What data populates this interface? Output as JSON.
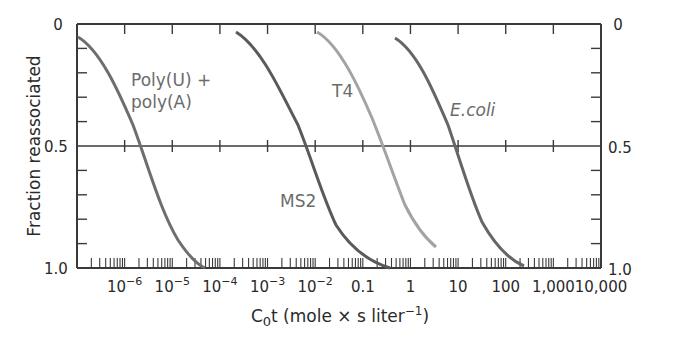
{
  "chart_data": {
    "type": "line",
    "title": "",
    "xlabel": "C0t (mole × s liter−1)",
    "xlabel_parts": {
      "c": "C",
      "sub": "0",
      "rest": "t (mole × s liter",
      "sup": "−1",
      "close": ")"
    },
    "ylabel": "Fraction reassociated",
    "x_scale": "log",
    "xlim": [
      1e-07,
      10000
    ],
    "ylim": [
      0,
      1.0
    ],
    "y_inverted": true,
    "x_tick_labels": [
      {
        "label": "10",
        "exp": "−6",
        "value": 1e-06
      },
      {
        "label": "10",
        "exp": "−5",
        "value": 1e-05
      },
      {
        "label": "10",
        "exp": "−4",
        "value": 0.0001
      },
      {
        "label": "10",
        "exp": "−3",
        "value": 0.001
      },
      {
        "label": "10",
        "exp": "−2",
        "value": 0.01
      },
      {
        "label": "0.1",
        "exp": "",
        "value": 0.1
      },
      {
        "label": "1",
        "exp": "",
        "value": 1
      },
      {
        "label": "10",
        "exp": "",
        "value": 10
      },
      {
        "label": "100",
        "exp": "",
        "value": 100
      },
      {
        "label": "1,000",
        "exp": "",
        "value": 1000
      },
      {
        "label": "10,000",
        "exp": "",
        "value": 10000
      }
    ],
    "y_tick_labels_left": [
      "0",
      "0.5",
      "1.0"
    ],
    "y_tick_labels_right": [
      "0",
      "0.5",
      "1.0"
    ],
    "reference_line": {
      "y": 0.5
    },
    "grid": false,
    "legend": "inline labels",
    "series": [
      {
        "name": "Poly(U) + poly(A)",
        "label_lines": [
          "Poly(U) +",
          "poly(A)"
        ],
        "color": "#6e6e6e",
        "cot_half": 2e-06,
        "points": [
          [
            1e-07,
            0.05
          ],
          [
            1e-06,
            0.3
          ],
          [
            2e-06,
            0.5
          ],
          [
            1e-05,
            0.85
          ],
          [
            7e-05,
            1.0
          ]
        ]
      },
      {
        "name": "MS2",
        "label_lines": [
          "MS2"
        ],
        "color": "#5a5a5a",
        "cot_half": 0.01,
        "points": [
          [
            0.0004,
            0.03
          ],
          [
            0.003,
            0.25
          ],
          [
            0.01,
            0.5
          ],
          [
            0.05,
            0.8
          ],
          [
            0.35,
            1.0
          ]
        ]
      },
      {
        "name": "T4",
        "label_lines": [
          "T4"
        ],
        "color": "#a0a0a0",
        "cot_half": 0.3,
        "points": [
          [
            0.02,
            0.03
          ],
          [
            0.1,
            0.25
          ],
          [
            0.3,
            0.5
          ],
          [
            1,
            0.75
          ],
          [
            5,
            0.92
          ]
        ]
      },
      {
        "name": "E.coli",
        "label_lines": [
          "E.coli"
        ],
        "color": "#666666",
        "cot_half": 10,
        "points": [
          [
            0.4,
            0.05
          ],
          [
            3,
            0.3
          ],
          [
            10,
            0.5
          ],
          [
            50,
            0.8
          ],
          [
            400,
            0.99
          ]
        ]
      }
    ]
  }
}
